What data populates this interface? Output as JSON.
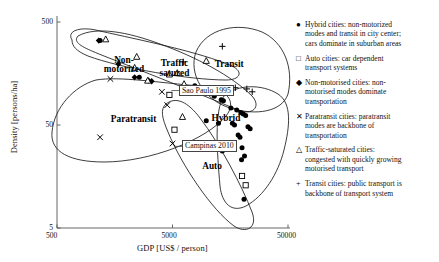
{
  "chart_data": {
    "type": "scatter",
    "title": "",
    "xlabel": "GDP [US$ / person]",
    "ylabel": "Density [persons/ha]",
    "xscale": "log",
    "yscale": "log",
    "xlim": [
      500,
      50000
    ],
    "ylim": [
      5,
      500
    ],
    "xticks": [
      "500",
      "5000",
      "50000"
    ],
    "yticks": [
      "500",
      "50",
      "5"
    ],
    "grid": false,
    "legend_position": "right",
    "series": [
      {
        "name": "Hybrid cities",
        "marker": "filled-circle",
        "points": [
          [
            1180,
            330
          ],
          [
            2580,
            145
          ],
          [
            7800,
            120
          ],
          [
            11500,
            95
          ],
          [
            13200,
            88
          ],
          [
            13800,
            86
          ],
          [
            16000,
            73
          ],
          [
            18000,
            70
          ],
          [
            19500,
            66
          ],
          [
            20500,
            64
          ],
          [
            21500,
            62
          ],
          [
            16500,
            52
          ],
          [
            17200,
            50
          ],
          [
            22500,
            48
          ],
          [
            23500,
            46
          ],
          [
            18500,
            40
          ],
          [
            19200,
            38
          ],
          [
            15500,
            33
          ],
          [
            20000,
            30
          ],
          [
            13500,
            28
          ],
          [
            21000,
            25
          ],
          [
            19800,
            23
          ],
          [
            20800,
            9.5
          ],
          [
            9800,
            55
          ],
          [
            12500,
            52
          ]
        ]
      },
      {
        "name": "Auto cities",
        "marker": "open-square",
        "points": [
          [
            4700,
            98
          ],
          [
            5200,
            45
          ],
          [
            20000,
            16
          ],
          [
            21500,
            13
          ]
        ]
      },
      {
        "name": "Non-motorised cities",
        "marker": "filled-diamond",
        "points": [
          [
            1150,
            330
          ],
          [
            1700,
            195
          ],
          [
            2350,
            145
          ],
          [
            3100,
            135
          ],
          [
            3300,
            133
          ]
        ]
      },
      {
        "name": "Paratransit cities",
        "marker": "cross",
        "points": [
          [
            1450,
            140
          ],
          [
            1180,
            38
          ],
          [
            4050,
            105
          ],
          [
            4500,
            78
          ],
          [
            5000,
            33
          ]
        ]
      },
      {
        "name": "Traffic-saturated cities",
        "marker": "open-triangle",
        "points": [
          [
            1320,
            340
          ],
          [
            2450,
            230
          ],
          [
            2350,
            180
          ],
          [
            3050,
            135
          ],
          [
            4700,
            155
          ],
          [
            5500,
            160
          ],
          [
            6300,
            125
          ],
          [
            9800,
            210
          ],
          [
            6100,
            60
          ]
        ]
      },
      {
        "name": "Transit cities",
        "marker": "plus",
        "points": [
          [
            6200,
            205
          ],
          [
            13500,
            290
          ],
          [
            17500,
            115
          ],
          [
            22000,
            112
          ],
          [
            24500,
            105
          ]
        ]
      }
    ],
    "cluster_labels": [
      {
        "text": "Non-\nmotorized",
        "x": 1900,
        "y": 205
      },
      {
        "text": "Traffic\nsatured",
        "x": 5200,
        "y": 190
      },
      {
        "text": "Transit",
        "x": 15500,
        "y": 185
      },
      {
        "text": "Paratransit",
        "x": 2300,
        "y": 55
      },
      {
        "text": "Hybrid",
        "x": 14500,
        "y": 56
      },
      {
        "text": "Auto",
        "x": 11000,
        "y": 19
      }
    ],
    "annotations": [
      {
        "text": "Sao Paulo 1995",
        "x": 4750,
        "y": 108
      },
      {
        "text": "Campinas 2010",
        "x": 5050,
        "y": 31
      }
    ]
  },
  "legend": {
    "entries": [
      {
        "marker": "●",
        "marker_name": "filled-circle-marker",
        "lines": [
          "Hybrid cities: non-motorized",
          "modes and transit in city center;",
          "cars dominate in suburban areas"
        ]
      },
      {
        "marker": "□",
        "marker_name": "open-square-marker",
        "lines": [
          "Auto cities: car dependent",
          "transport systems"
        ]
      },
      {
        "marker": "◆",
        "marker_name": "filled-diamond-marker",
        "lines": [
          "Non-motorised cities: non-",
          "motorised modes dominate",
          "transportation"
        ]
      },
      {
        "marker": "✕",
        "marker_name": "cross-marker",
        "lines": [
          "Paratransit cities: paratransit",
          "modes are backbone of",
          "transportation"
        ]
      },
      {
        "marker": "△",
        "marker_name": "open-triangle-marker",
        "lines": [
          "Traffic-saturated cities:",
          "congested with quickly growing",
          "motorised transport"
        ]
      },
      {
        "marker": "+",
        "marker_name": "plus-marker",
        "lines": [
          "Transit cities: public transport is",
          "backbone of transport system"
        ]
      }
    ]
  }
}
